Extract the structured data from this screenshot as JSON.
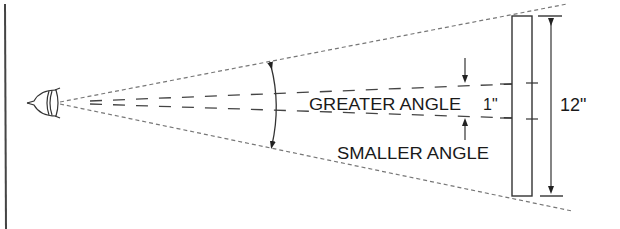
{
  "diagram": {
    "type": "visual-angle-illustration",
    "labels": {
      "greater_angle": "GREATER ANGLE",
      "smaller_angle": "SMALLER ANGLE",
      "inner_dimension": "1\"",
      "outer_dimension": "12\""
    },
    "elements": {
      "observer": "eye-icon",
      "target": "object-bar",
      "wide_cone": "dotted-lines",
      "narrow_cone": "dashed-lines",
      "angle_arc": "double-arrow-arc"
    },
    "colors": {
      "line": "#333333",
      "dotted": "#777777",
      "background": "#ffffff"
    }
  }
}
